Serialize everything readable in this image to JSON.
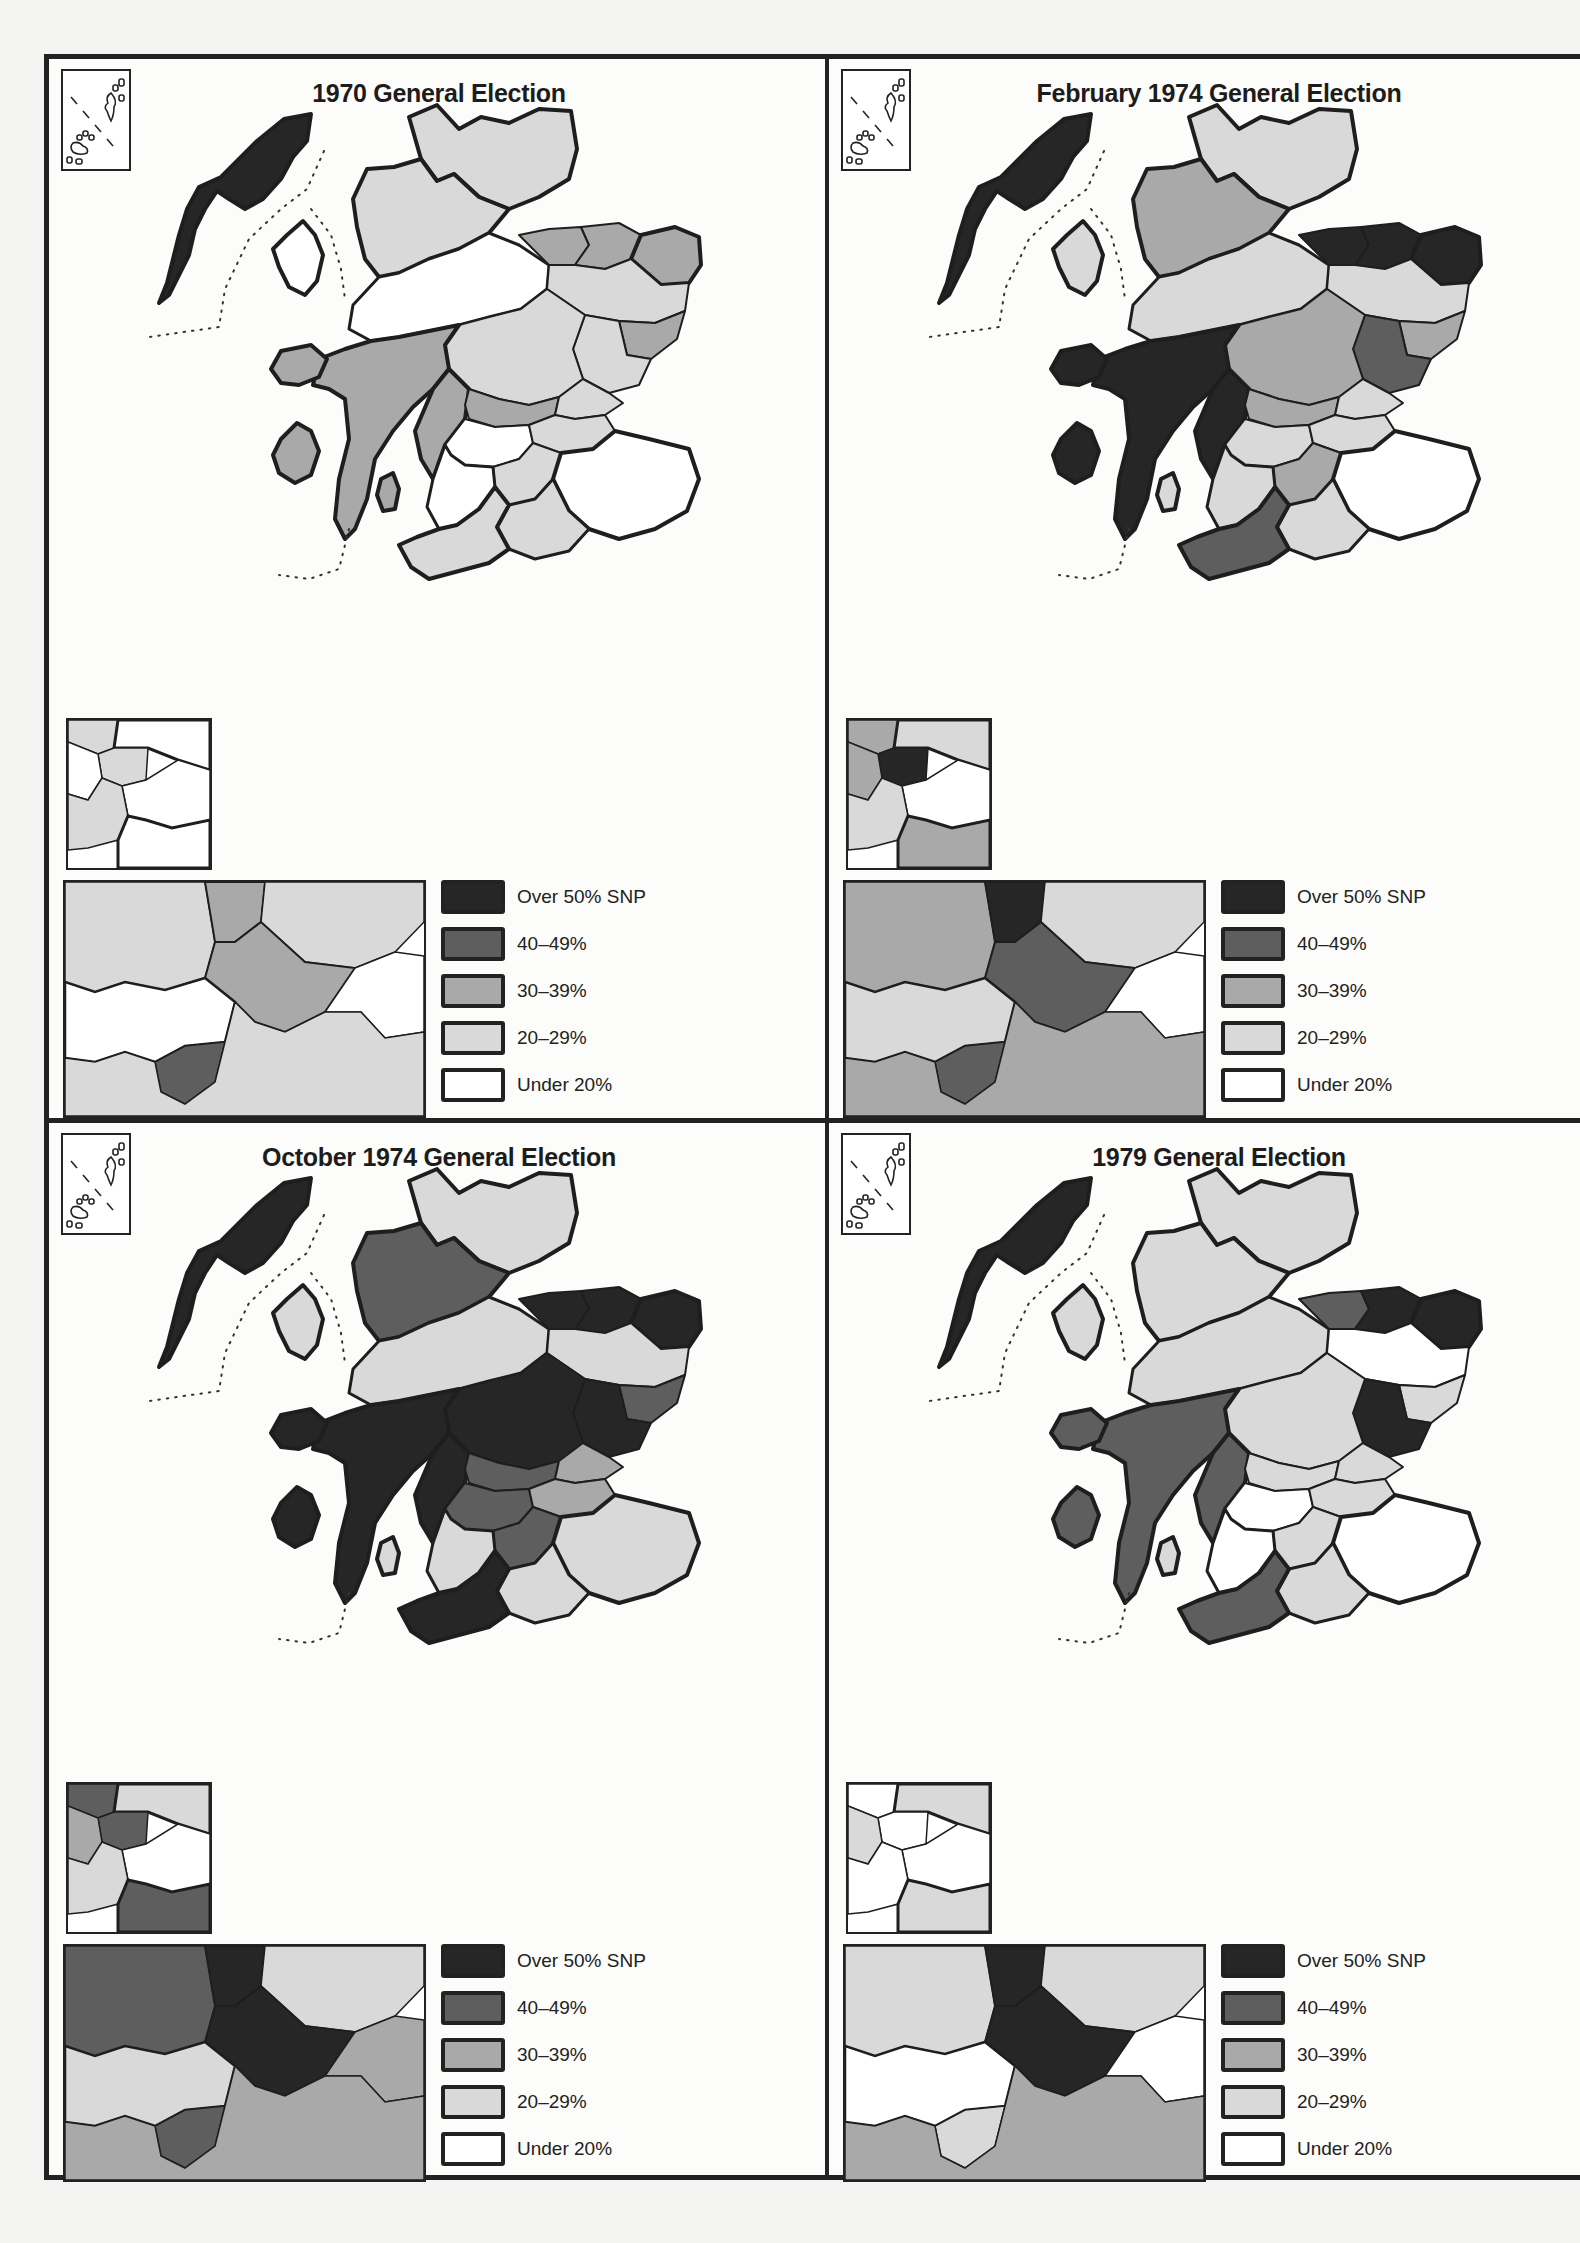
{
  "colors": {
    "over50": "#262626",
    "r40_49": "#5e5e5e",
    "r30_39": "#a9a9a9",
    "r20_29": "#d9d9d9",
    "under20": "#ffffff",
    "outline": "#1e1e1e"
  },
  "legend": [
    {
      "key": "over50",
      "label": "Over 50% SNP",
      "color": "#262626"
    },
    {
      "key": "r40_49",
      "label": "40–49%",
      "color": "#5e5e5e"
    },
    {
      "key": "r30_39",
      "label": "30–39%",
      "color": "#a9a9a9"
    },
    {
      "key": "r20_29",
      "label": "20–29%",
      "color": "#d9d9d9"
    },
    {
      "key": "under20",
      "label": "Under 20%",
      "color": "#ffffff"
    }
  ],
  "panels": [
    {
      "title": "1970 General Election",
      "regions": {
        "western_isles": "#262626",
        "caithness_sutherland": "#d9d9d9",
        "ross_cromarty": "#d9d9d9",
        "skye": "#ffffff",
        "inverness": "#ffffff",
        "moray_nairn": "#a9a9a9",
        "banff": "#a9a9a9",
        "aberdeenshire_east": "#a9a9a9",
        "aberdeenshire_west": "#d9d9d9",
        "kincardine": "#a9a9a9",
        "angus": "#d9d9d9",
        "perth": "#d9d9d9",
        "argyll_north": "#a9a9a9",
        "argyll_south": "#a9a9a9",
        "islay_jura": "#a9a9a9",
        "mull": "#a9a9a9",
        "arran": "#a9a9a9",
        "stirling_clack": "#a9a9a9",
        "fife": "#d9d9d9",
        "central_belt": "#ffffff",
        "lanark": "#d9d9d9",
        "ayr": "#ffffff",
        "galloway": "#d9d9d9",
        "dumfries": "#d9d9d9",
        "borders": "#ffffff",
        "lothian": "#d9d9d9"
      },
      "inset_small": [
        "#d9d9d9",
        "#ffffff",
        "#d9d9d9",
        "#ffffff",
        "#ffffff",
        "#d9d9d9",
        "#ffffff"
      ],
      "inset_large": [
        "#d9d9d9",
        "#a9a9a9",
        "#d9d9d9",
        "#a9a9a9",
        "#ffffff",
        "#ffffff",
        "#5e5e5e",
        "#d9d9d9"
      ]
    },
    {
      "title": "February 1974 General Election",
      "regions": {
        "western_isles": "#262626",
        "caithness_sutherland": "#d9d9d9",
        "ross_cromarty": "#a9a9a9",
        "skye": "#d9d9d9",
        "inverness": "#d9d9d9",
        "moray_nairn": "#262626",
        "banff": "#262626",
        "aberdeenshire_east": "#262626",
        "aberdeenshire_west": "#d9d9d9",
        "kincardine": "#a9a9a9",
        "angus": "#5e5e5e",
        "perth": "#a9a9a9",
        "argyll_north": "#262626",
        "argyll_south": "#262626",
        "islay_jura": "#262626",
        "mull": "#262626",
        "arran": "#d9d9d9",
        "stirling_clack": "#a9a9a9",
        "fife": "#d9d9d9",
        "central_belt": "#d9d9d9",
        "lanark": "#a9a9a9",
        "ayr": "#d9d9d9",
        "galloway": "#5e5e5e",
        "dumfries": "#d9d9d9",
        "borders": "#ffffff",
        "lothian": "#d9d9d9"
      },
      "inset_small": [
        "#a9a9a9",
        "#d9d9d9",
        "#262626",
        "#a9a9a9",
        "#ffffff",
        "#d9d9d9",
        "#a9a9a9"
      ],
      "inset_large": [
        "#a9a9a9",
        "#262626",
        "#d9d9d9",
        "#5e5e5e",
        "#ffffff",
        "#d9d9d9",
        "#5e5e5e",
        "#a9a9a9"
      ]
    },
    {
      "title": "October 1974 General Election",
      "regions": {
        "western_isles": "#262626",
        "caithness_sutherland": "#d9d9d9",
        "ross_cromarty": "#5e5e5e",
        "skye": "#d9d9d9",
        "inverness": "#d9d9d9",
        "moray_nairn": "#262626",
        "banff": "#262626",
        "aberdeenshire_east": "#262626",
        "aberdeenshire_west": "#d9d9d9",
        "kincardine": "#5e5e5e",
        "angus": "#262626",
        "perth": "#262626",
        "argyll_north": "#262626",
        "argyll_south": "#262626",
        "islay_jura": "#262626",
        "mull": "#262626",
        "arran": "#d9d9d9",
        "stirling_clack": "#5e5e5e",
        "fife": "#a9a9a9",
        "central_belt": "#5e5e5e",
        "lanark": "#5e5e5e",
        "ayr": "#d9d9d9",
        "galloway": "#262626",
        "dumfries": "#d9d9d9",
        "borders": "#d9d9d9",
        "lothian": "#a9a9a9"
      },
      "inset_small": [
        "#5e5e5e",
        "#d9d9d9",
        "#5e5e5e",
        "#a9a9a9",
        "#ffffff",
        "#d9d9d9",
        "#5e5e5e"
      ],
      "inset_large": [
        "#5e5e5e",
        "#262626",
        "#d9d9d9",
        "#262626",
        "#a9a9a9",
        "#d9d9d9",
        "#5e5e5e",
        "#a9a9a9"
      ]
    },
    {
      "title": "1979 General Election",
      "regions": {
        "western_isles": "#262626",
        "caithness_sutherland": "#d9d9d9",
        "ross_cromarty": "#d9d9d9",
        "skye": "#d9d9d9",
        "inverness": "#d9d9d9",
        "moray_nairn": "#5e5e5e",
        "banff": "#262626",
        "aberdeenshire_east": "#262626",
        "aberdeenshire_west": "#ffffff",
        "kincardine": "#d9d9d9",
        "angus": "#262626",
        "perth": "#d9d9d9",
        "argyll_north": "#5e5e5e",
        "argyll_south": "#5e5e5e",
        "islay_jura": "#5e5e5e",
        "mull": "#5e5e5e",
        "arran": "#d9d9d9",
        "stirling_clack": "#d9d9d9",
        "fife": "#d9d9d9",
        "central_belt": "#ffffff",
        "lanark": "#d9d9d9",
        "ayr": "#ffffff",
        "galloway": "#5e5e5e",
        "dumfries": "#d9d9d9",
        "borders": "#ffffff",
        "lothian": "#d9d9d9"
      },
      "inset_small": [
        "#ffffff",
        "#d9d9d9",
        "#ffffff",
        "#d9d9d9",
        "#ffffff",
        "#ffffff",
        "#d9d9d9"
      ],
      "inset_large": [
        "#d9d9d9",
        "#262626",
        "#d9d9d9",
        "#262626",
        "#ffffff",
        "#ffffff",
        "#d9d9d9",
        "#a9a9a9"
      ]
    }
  ]
}
